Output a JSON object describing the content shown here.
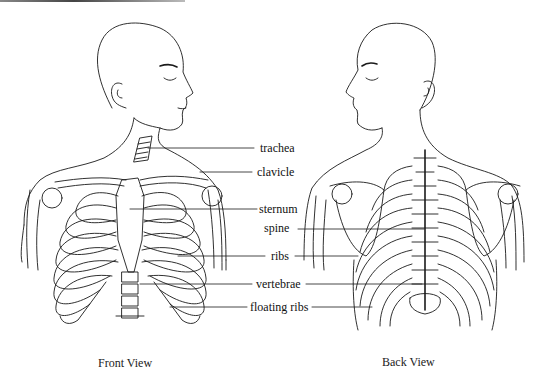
{
  "figure": {
    "front_view": {
      "caption": "Front View",
      "labels": [
        "trachea",
        "clavicle",
        "sternum",
        "ribs",
        "vertebrae",
        "floating ribs"
      ]
    },
    "back_view": {
      "caption": "Back View",
      "labels": [
        "spine",
        "ribs",
        "vertebrae",
        "floating ribs"
      ]
    }
  },
  "labels": {
    "trachea": "trachea",
    "clavicle": "clavicle",
    "sternum": "sternum",
    "spine": "spine",
    "ribs": "ribs",
    "vertebrae": "vertebrae",
    "floating_ribs": "floating ribs"
  },
  "captions": {
    "front": "Front View",
    "back": "Back View"
  },
  "colors": {
    "line": "#1a1a1a",
    "background": "#ffffff"
  }
}
